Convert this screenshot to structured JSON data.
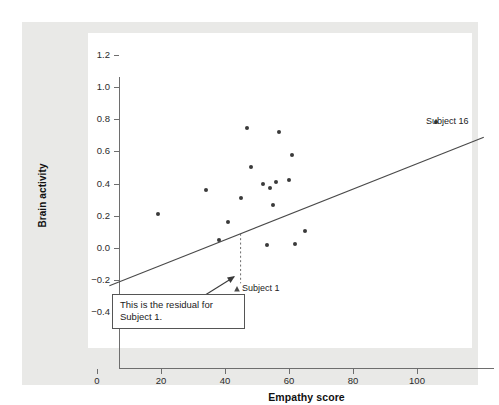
{
  "chart_data": {
    "type": "scatter",
    "title": "",
    "xlabel": "Empathy score",
    "ylabel": "Brain activity",
    "xlim": [
      -3,
      114
    ],
    "ylim": [
      -0.51,
      1.31
    ],
    "xticks": [
      0,
      20,
      40,
      60,
      80,
      100
    ],
    "xticklabels": [
      "0",
      "20",
      "40",
      "60",
      "80",
      "100"
    ],
    "yticks": [
      1.2,
      1.0,
      0.8,
      0.6,
      0.4,
      0.2,
      0.0,
      -0.2,
      -0.4
    ],
    "yticklabels": [
      "1.2",
      "1.0",
      "0.8",
      "0.6",
      "0.4",
      "0.2",
      "0.0",
      "−0.2",
      "−0.4"
    ],
    "grid": false,
    "legend": null,
    "points": [
      {
        "x": 19,
        "y": 0.21,
        "label": ""
      },
      {
        "x": 34,
        "y": 0.36,
        "label": ""
      },
      {
        "x": 38,
        "y": 0.05,
        "label": "Subject 1"
      },
      {
        "x": 41,
        "y": 0.16,
        "label": ""
      },
      {
        "x": 45,
        "y": 0.31,
        "label": ""
      },
      {
        "x": 47,
        "y": 0.745,
        "label": ""
      },
      {
        "x": 48,
        "y": 0.5,
        "label": ""
      },
      {
        "x": 52,
        "y": 0.395,
        "label": ""
      },
      {
        "x": 53,
        "y": 0.02,
        "label": ""
      },
      {
        "x": 54,
        "y": 0.375,
        "label": ""
      },
      {
        "x": 55,
        "y": 0.265,
        "label": ""
      },
      {
        "x": 56,
        "y": 0.41,
        "label": ""
      },
      {
        "x": 57,
        "y": 0.72,
        "label": ""
      },
      {
        "x": 60,
        "y": 0.42,
        "label": ""
      },
      {
        "x": 61,
        "y": 0.575,
        "label": ""
      },
      {
        "x": 62,
        "y": 0.025,
        "label": ""
      },
      {
        "x": 65,
        "y": 0.105,
        "label": ""
      },
      {
        "x": 106,
        "y": 0.78,
        "label": "Subject 16"
      }
    ],
    "regression_line": {
      "type": "line",
      "x_start": -3,
      "y_start": -0.1,
      "x_end": 114,
      "y_end": 0.825,
      "slope": 0.0079,
      "intercept": -0.076,
      "color": "#4a4a4a"
    },
    "residual_segment": {
      "x": 38,
      "y_point": 0.05,
      "y_fit": 0.224,
      "style": "dashed",
      "color": "#6b6b6b"
    },
    "annotations": [
      {
        "name": "residual-note",
        "text": "This is the residual for Subject 1."
      },
      {
        "name": "subject-1-label",
        "text": "Subject 1"
      },
      {
        "name": "subject-16-label",
        "text": "Subject 16"
      }
    ]
  },
  "colors": {
    "figure_background": "#e9e9e7",
    "plot_background": "#ffffff",
    "axis": "#6e6e6e",
    "point": "#3a3a3a",
    "line": "#4a4a4a",
    "text": "#1a1a1a"
  }
}
